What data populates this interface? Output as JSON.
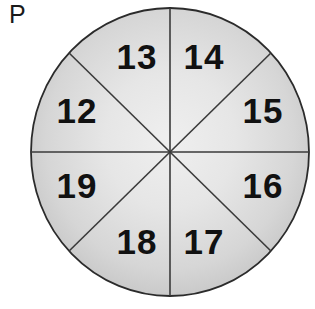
{
  "figure": {
    "corner_label": "P",
    "shape": "circle",
    "sectors_count": 8,
    "colors": {
      "fill_center": "#ececec",
      "fill_edge": "#c3c3c3",
      "outline": "#2b2b2b",
      "spoke": "#3a3a3a",
      "number": "#111111",
      "background": "#ffffff"
    },
    "geometry": {
      "center_x": 170,
      "center_y": 152,
      "radius_x": 139,
      "radius_y": 144
    },
    "sectors": [
      {
        "id": "sector-12",
        "label": "12",
        "position": "west-north",
        "angle_deg": 157.5,
        "cx": 77,
        "cy": 112
      },
      {
        "id": "sector-13",
        "label": "13",
        "position": "north-west",
        "angle_deg": 112.5,
        "cx": 137,
        "cy": 58
      },
      {
        "id": "sector-14",
        "label": "14",
        "position": "north-east",
        "angle_deg": 67.5,
        "cx": 204,
        "cy": 58
      },
      {
        "id": "sector-15",
        "label": "15",
        "position": "east-north",
        "angle_deg": 22.5,
        "cx": 263,
        "cy": 112
      },
      {
        "id": "sector-16",
        "label": "16",
        "position": "east-south",
        "angle_deg": 337.5,
        "cx": 263,
        "cy": 187
      },
      {
        "id": "sector-17",
        "label": "17",
        "position": "south-east",
        "angle_deg": 292.5,
        "cx": 204,
        "cy": 243
      },
      {
        "id": "sector-18",
        "label": "18",
        "position": "south-west",
        "angle_deg": 247.5,
        "cx": 137,
        "cy": 243
      },
      {
        "id": "sector-19",
        "label": "19",
        "position": "west-south",
        "angle_deg": 202.5,
        "cx": 77,
        "cy": 187
      }
    ],
    "diameters": [
      {
        "id": "vertical-diameter",
        "orientation": "vertical"
      },
      {
        "id": "horizontal-diameter",
        "orientation": "horizontal"
      },
      {
        "id": "diagonal-nw-se",
        "orientation": "diagonal-nw-se"
      },
      {
        "id": "diagonal-ne-sw",
        "orientation": "diagonal-ne-sw"
      }
    ]
  }
}
